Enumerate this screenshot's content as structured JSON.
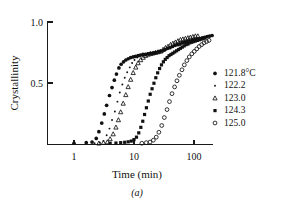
{
  "chart_data": {
    "type": "scatter",
    "title": "",
    "xlabel": "Time (min)",
    "ylabel": "Crystallinity",
    "caption": "(a)",
    "xscale": "log",
    "xlim": [
      0.6,
      300
    ],
    "ylim": [
      0.0,
      1.05
    ],
    "xticks": [
      1,
      10,
      100
    ],
    "xticklabels": [
      "1",
      "10",
      "100"
    ],
    "yticks": [
      0.5,
      1.0
    ],
    "yticklabels": [
      "0.5",
      "1.0"
    ],
    "grid": false,
    "legend_position": "right",
    "series": [
      {
        "name": "121.8°C",
        "label": "121.8°C",
        "marker": "filled-circle",
        "color": "#111111",
        "points": [
          [
            1.0,
            0.01
          ],
          [
            1.6,
            0.015
          ],
          [
            2.0,
            0.02
          ],
          [
            2.35,
            0.05
          ],
          [
            2.6,
            0.105
          ],
          [
            2.9,
            0.175
          ],
          [
            3.2,
            0.25
          ],
          [
            3.5,
            0.32
          ],
          [
            3.9,
            0.4
          ],
          [
            4.3,
            0.465
          ],
          [
            4.7,
            0.525
          ],
          [
            5.1,
            0.575
          ],
          [
            5.6,
            0.625
          ],
          [
            6.1,
            0.655
          ],
          [
            6.7,
            0.675
          ],
          [
            7.3,
            0.69
          ],
          [
            8.0,
            0.7
          ],
          [
            8.8,
            0.71
          ],
          [
            9.7,
            0.715
          ],
          [
            10.6,
            0.72
          ],
          [
            11.7,
            0.725
          ],
          [
            12.8,
            0.73
          ],
          [
            14.1,
            0.735
          ],
          [
            15.5,
            0.735
          ],
          [
            17.0,
            0.74
          ],
          [
            18.7,
            0.745
          ],
          [
            20.6,
            0.745
          ],
          [
            22.6,
            0.75
          ],
          [
            24.9,
            0.755
          ],
          [
            27.3,
            0.76
          ],
          [
            30.1,
            0.765
          ],
          [
            33.0,
            0.775
          ],
          [
            36.3,
            0.785
          ],
          [
            39.9,
            0.79
          ],
          [
            43.9,
            0.8
          ],
          [
            48.2,
            0.81
          ],
          [
            53.0,
            0.815
          ],
          [
            58.3,
            0.82
          ],
          [
            64.0,
            0.83
          ],
          [
            70.4,
            0.835
          ],
          [
            77.4,
            0.84
          ],
          [
            85.0,
            0.845
          ],
          [
            93.5,
            0.85
          ],
          [
            102.8,
            0.855
          ],
          [
            113.0,
            0.86
          ],
          [
            124.0,
            0.865
          ],
          [
            137.0,
            0.87
          ],
          [
            150.0,
            0.875
          ],
          [
            165.0,
            0.88
          ],
          [
            182.0,
            0.885
          ],
          [
            200.0,
            0.89
          ]
        ]
      },
      {
        "name": "122.2",
        "label": "122.2",
        "marker": "small-dot",
        "color": "#111111",
        "points": [
          [
            2.2,
            0.01
          ],
          [
            2.7,
            0.015
          ],
          [
            3.1,
            0.03
          ],
          [
            3.5,
            0.075
          ],
          [
            3.9,
            0.13
          ],
          [
            4.3,
            0.2
          ],
          [
            4.8,
            0.27
          ],
          [
            5.3,
            0.35
          ],
          [
            5.8,
            0.425
          ],
          [
            6.4,
            0.49
          ],
          [
            7.0,
            0.545
          ],
          [
            7.7,
            0.59
          ],
          [
            8.5,
            0.63
          ],
          [
            9.3,
            0.665
          ],
          [
            10.2,
            0.69
          ],
          [
            11.3,
            0.71
          ],
          [
            12.4,
            0.72
          ],
          [
            13.6,
            0.73
          ],
          [
            15.0,
            0.735
          ],
          [
            16.5,
            0.74
          ],
          [
            18.1,
            0.745
          ],
          [
            19.9,
            0.75
          ],
          [
            21.9,
            0.755
          ],
          [
            24.1,
            0.755
          ],
          [
            26.5,
            0.76
          ],
          [
            29.2,
            0.765
          ],
          [
            32.1,
            0.77
          ],
          [
            35.3,
            0.78
          ],
          [
            38.8,
            0.79
          ],
          [
            42.7,
            0.8
          ],
          [
            47.0,
            0.81
          ],
          [
            51.7,
            0.815
          ],
          [
            56.8,
            0.82
          ],
          [
            62.5,
            0.83
          ],
          [
            68.8,
            0.835
          ],
          [
            75.6,
            0.84
          ],
          [
            83.2,
            0.845
          ],
          [
            91.5,
            0.85
          ],
          [
            100.6,
            0.855
          ],
          [
            110.7,
            0.86
          ],
          [
            121.8,
            0.865
          ],
          [
            134.0,
            0.87
          ]
        ]
      },
      {
        "name": "123.0",
        "label": "123.0",
        "marker": "open-triangle",
        "color": "#111111",
        "points": [
          [
            2.6,
            0.01
          ],
          [
            3.1,
            0.015
          ],
          [
            3.6,
            0.02
          ],
          [
            4.0,
            0.045
          ],
          [
            4.5,
            0.085
          ],
          [
            5.0,
            0.14
          ],
          [
            5.5,
            0.2
          ],
          [
            6.0,
            0.265
          ],
          [
            6.6,
            0.335
          ],
          [
            7.3,
            0.405
          ],
          [
            8.0,
            0.47
          ],
          [
            8.8,
            0.53
          ],
          [
            9.7,
            0.585
          ],
          [
            10.7,
            0.63
          ],
          [
            11.7,
            0.665
          ],
          [
            12.9,
            0.69
          ],
          [
            14.2,
            0.71
          ],
          [
            15.6,
            0.725
          ],
          [
            17.2,
            0.735
          ],
          [
            18.9,
            0.74
          ],
          [
            20.8,
            0.745
          ],
          [
            22.9,
            0.75
          ],
          [
            25.2,
            0.755
          ],
          [
            27.7,
            0.76
          ],
          [
            30.5,
            0.775
          ],
          [
            33.5,
            0.79
          ],
          [
            36.9,
            0.8
          ],
          [
            40.6,
            0.815
          ],
          [
            44.6,
            0.825
          ],
          [
            49.1,
            0.835
          ],
          [
            54.0,
            0.845
          ],
          [
            59.4,
            0.855
          ],
          [
            65.3,
            0.86
          ],
          [
            71.9,
            0.865
          ],
          [
            79.1,
            0.87
          ],
          [
            87.0,
            0.875
          ],
          [
            95.7,
            0.88
          ],
          [
            105.2,
            0.885
          ],
          [
            115.8,
            0.885
          ]
        ]
      },
      {
        "name": "124.3",
        "label": "124.3",
        "marker": "filled-square",
        "color": "#111111",
        "points": [
          [
            4.0,
            0.01
          ],
          [
            5.0,
            0.012
          ],
          [
            6.0,
            0.015
          ],
          [
            7.0,
            0.018
          ],
          [
            8.0,
            0.022
          ],
          [
            9.0,
            0.028
          ],
          [
            10.0,
            0.04
          ],
          [
            11.0,
            0.06
          ],
          [
            12.0,
            0.095
          ],
          [
            13.0,
            0.14
          ],
          [
            14.0,
            0.19
          ],
          [
            15.0,
            0.245
          ],
          [
            16.1,
            0.3
          ],
          [
            17.3,
            0.355
          ],
          [
            18.6,
            0.41
          ],
          [
            20.0,
            0.455
          ],
          [
            21.5,
            0.5
          ],
          [
            23.1,
            0.545
          ],
          [
            24.8,
            0.585
          ],
          [
            26.7,
            0.62
          ],
          [
            28.7,
            0.65
          ],
          [
            30.9,
            0.675
          ],
          [
            33.2,
            0.695
          ],
          [
            35.7,
            0.71
          ],
          [
            38.4,
            0.725
          ],
          [
            41.3,
            0.735
          ],
          [
            44.4,
            0.745
          ],
          [
            47.7,
            0.755
          ],
          [
            51.3,
            0.765
          ],
          [
            55.2,
            0.775
          ],
          [
            59.3,
            0.785
          ],
          [
            63.8,
            0.795
          ],
          [
            68.6,
            0.805
          ],
          [
            73.7,
            0.815
          ],
          [
            79.3,
            0.82
          ],
          [
            85.2,
            0.83
          ],
          [
            91.6,
            0.835
          ],
          [
            98.5,
            0.84
          ],
          [
            105.9,
            0.845
          ],
          [
            113.8,
            0.85
          ],
          [
            122.4,
            0.855
          ],
          [
            131.6,
            0.86
          ],
          [
            141.5,
            0.865
          ],
          [
            152.1,
            0.87
          ]
        ]
      },
      {
        "name": "125.0",
        "label": "125.0",
        "marker": "open-circle",
        "color": "#111111",
        "points": [
          [
            13.5,
            0.01
          ],
          [
            16.0,
            0.015
          ],
          [
            18.5,
            0.02
          ],
          [
            21.0,
            0.035
          ],
          [
            23.5,
            0.06
          ],
          [
            26.0,
            0.1
          ],
          [
            29.0,
            0.155
          ],
          [
            32.0,
            0.22
          ],
          [
            35.5,
            0.285
          ],
          [
            39.0,
            0.35
          ],
          [
            43.0,
            0.415
          ],
          [
            47.5,
            0.47
          ],
          [
            52.0,
            0.52
          ],
          [
            57.0,
            0.565
          ],
          [
            63.0,
            0.61
          ],
          [
            69.0,
            0.65
          ],
          [
            76.0,
            0.685
          ],
          [
            83.5,
            0.715
          ],
          [
            92.0,
            0.74
          ],
          [
            101.0,
            0.76
          ],
          [
            111.0,
            0.78
          ],
          [
            122.0,
            0.8
          ],
          [
            134.0,
            0.815
          ],
          [
            147.0,
            0.83
          ],
          [
            162.0,
            0.84
          ],
          [
            178.0,
            0.85
          ]
        ]
      }
    ]
  },
  "legend": {
    "entries": [
      {
        "label": "121.8°C",
        "marker": "filled-circle"
      },
      {
        "label": "122.2",
        "marker": "small-dot"
      },
      {
        "label": "123.0",
        "marker": "open-triangle"
      },
      {
        "label": "124.3",
        "marker": "filled-square"
      },
      {
        "label": "125.0",
        "marker": "open-circle"
      }
    ]
  }
}
